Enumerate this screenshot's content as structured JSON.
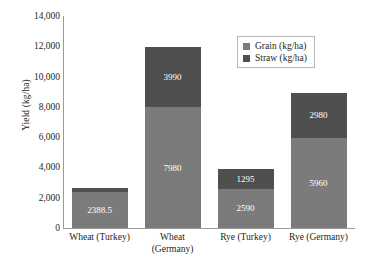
{
  "chart_data": {
    "type": "bar",
    "subtype": "stacked-bar",
    "title": "",
    "xlabel": "",
    "ylabel": "Yield (kg/ha)",
    "ylim": [
      0,
      14000
    ],
    "ytick_step": 2000,
    "ytick_labels": [
      "14,000",
      "12,000",
      "10,000",
      "8,000",
      "6,000",
      "4,000",
      "2,000",
      "0"
    ],
    "ytick_values": [
      14000,
      12000,
      10000,
      8000,
      6000,
      4000,
      2000,
      0
    ],
    "grid": false,
    "legend_position": "top-right",
    "categories": [
      "Wheat (Turkey)",
      "Wheat (Germany)",
      "Rye (Turkey)",
      "Rye (Germany)"
    ],
    "category_lines": [
      [
        "Wheat (Turkey)"
      ],
      [
        "Wheat",
        "(Germany)"
      ],
      [
        "Rye (Turkey)"
      ],
      [
        "Rye (Germany)"
      ]
    ],
    "series": [
      {
        "name": "Grain (kg/ha)",
        "color": "#7b7b7b",
        "values": [
          2388.5,
          7980,
          2590,
          5960
        ],
        "labels": [
          "2388.5",
          "7980",
          "2590",
          "5960"
        ]
      },
      {
        "name": "Straw (kg/ha)",
        "color": "#4f4f4f",
        "values": [
          223.6,
          3990,
          1295,
          2980
        ],
        "labels": [
          "223.6",
          "3990",
          "1295",
          "2980"
        ]
      }
    ],
    "totals": [
      2612.1,
      11970,
      3885,
      8940
    ]
  },
  "legend": {
    "items": [
      {
        "label": "Grain (kg/ha)",
        "color": "#7b7b7b"
      },
      {
        "label": "Straw (kg/ha)",
        "color": "#4f4f4f"
      }
    ]
  },
  "colors": {
    "grain": "#7b7b7b",
    "straw": "#4f4f4f",
    "axis": "#9a9a9a",
    "text": "#231f20",
    "label_text": "#ffffff",
    "background": "#ffffff"
  }
}
